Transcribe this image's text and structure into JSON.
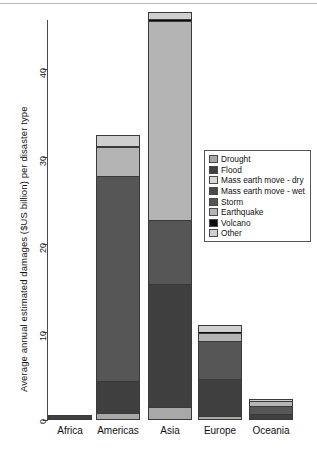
{
  "chart_data": {
    "type": "bar",
    "stacked": true,
    "title": "",
    "xlabel": "",
    "ylabel": "Average annual estimated damages ($US billion) per disaster type",
    "categories": [
      "Africa",
      "Americas",
      "Asia",
      "Europe",
      "Oceania"
    ],
    "ylim": [
      0,
      46.5
    ],
    "yticks": [
      0,
      10,
      20,
      30,
      40
    ],
    "ytick_labels": [
      "0",
      "10",
      "20",
      "30",
      "40"
    ],
    "grid": false,
    "legend_position": "center-right",
    "series": [
      {
        "name": "Drought",
        "color": "#a8a8a8",
        "values": [
          0.15,
          0.8,
          1.5,
          0.45,
          0.1
        ]
      },
      {
        "name": "Flood",
        "color": "#3f3f3f",
        "values": [
          0.45,
          3.7,
          14.0,
          4.2,
          0.55
        ]
      },
      {
        "name": "Mass earth move - dry",
        "color": "#d9d9d9",
        "values": [
          0.0,
          0.0,
          0.0,
          0.0,
          0.0
        ]
      },
      {
        "name": "Mass earth move - wet",
        "color": "#4a4a4a",
        "values": [
          0.0,
          0.0,
          0.0,
          0.0,
          0.0
        ]
      },
      {
        "name": "Storm",
        "color": "#565656",
        "values": [
          0.0,
          23.3,
          7.3,
          4.3,
          0.95
        ]
      },
      {
        "name": "Earthquake",
        "color": "#b4b4b4",
        "values": [
          0.0,
          3.3,
          22.6,
          1.0,
          0.55
        ]
      },
      {
        "name": "Volcano",
        "color": "#0d0d0d",
        "values": [
          0.0,
          0.1,
          0.3,
          0.05,
          0.05
        ]
      },
      {
        "name": "Other",
        "color": "#cfcfcf",
        "values": [
          0.0,
          1.3,
          0.8,
          0.8,
          0.2
        ]
      }
    ],
    "totals": [
      0.6,
      32.5,
      46.5,
      10.8,
      2.4
    ]
  },
  "axis": {
    "y_title": "Average annual estimated damages ($US billion) per disaster type"
  },
  "legend": {
    "items": [
      {
        "label": "Drought"
      },
      {
        "label": "Flood"
      },
      {
        "label": "Mass earth move - dry"
      },
      {
        "label": "Mass earth move - wet"
      },
      {
        "label": "Storm"
      },
      {
        "label": "Earthquake"
      },
      {
        "label": "Volcano"
      },
      {
        "label": "Other"
      }
    ]
  }
}
